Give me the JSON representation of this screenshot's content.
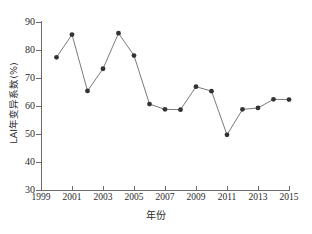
{
  "chart_data": {
    "type": "line",
    "title": "",
    "subtitle": "",
    "xlabel": "年份",
    "ylabel": "LAI年变异系数(%)",
    "xlim": [
      1999,
      2015
    ],
    "ylim": [
      30,
      90
    ],
    "grid": false,
    "legend": null,
    "x_ticks": [
      "1999",
      "2001",
      "2003",
      "2005",
      "2007",
      "2009",
      "2011",
      "2013",
      "2015"
    ],
    "x_tick_values": [
      1999,
      2001,
      2003,
      2005,
      2007,
      2009,
      2011,
      2013,
      2015
    ],
    "y_ticks": [
      "30",
      "40",
      "50",
      "60",
      "70",
      "80",
      "90"
    ],
    "y_tick_values": [
      30,
      40,
      50,
      60,
      70,
      80,
      90
    ],
    "marker": "filled-circle",
    "marker_color": "#333333",
    "line_color": "#6b6b6b",
    "x": [
      2000,
      2001,
      2002,
      2003,
      2004,
      2005,
      2006,
      2007,
      2008,
      2009,
      2010,
      2011,
      2012,
      2013,
      2014,
      2015
    ],
    "values": [
      77.4,
      85.5,
      65.4,
      73.3,
      86.0,
      78.0,
      60.7,
      58.8,
      58.7,
      66.9,
      65.3,
      49.7,
      58.8,
      59.3,
      62.4,
      62.3
    ],
    "series": [
      {
        "name": "LAI年变异系数(%)",
        "values": [
          77.4,
          85.5,
          65.4,
          73.3,
          86.0,
          78.0,
          60.7,
          58.8,
          58.7,
          66.9,
          65.3,
          49.7,
          58.8,
          59.3,
          62.4,
          62.3
        ]
      }
    ]
  }
}
